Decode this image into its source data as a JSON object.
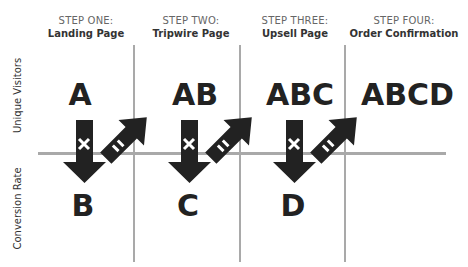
{
  "steps": [
    {
      "number": "STEP ONE:",
      "name": "Landing Page"
    },
    {
      "number": "STEP TWO:",
      "name": "Tripwire Page"
    },
    {
      "number": "STEP THREE:",
      "name": "Upsell Page"
    },
    {
      "number": "STEP FOUR:",
      "name": "Order Confirmation"
    }
  ],
  "axes": {
    "top_row_label": "Unique Visitors",
    "bottom_row_label": "Conversion Rate"
  },
  "visitors": [
    "A",
    "AB",
    "ABC",
    "ABCD"
  ],
  "conversion_rates": [
    "B",
    "C",
    "D"
  ],
  "operators": {
    "multiply": "×",
    "equals": "="
  },
  "colors": {
    "ink": "#222222",
    "grid": "#a9a9a9",
    "step_number": "#666666"
  }
}
